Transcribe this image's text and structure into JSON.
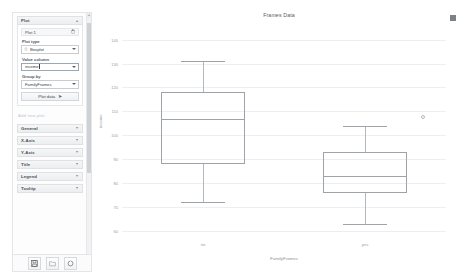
{
  "sidebar": {
    "plot_section": {
      "title": "Plot",
      "collapse_icon": "chevron-up-icon",
      "plot_item_label": "Plot 1",
      "delete_icon": "trash-icon",
      "fields": [
        {
          "label": "Plot type",
          "value": "Boxplot",
          "icon": "boxplot-icon"
        },
        {
          "label": "Value column",
          "value": "income",
          "icon": ""
        },
        {
          "label": "Group by",
          "value": "FamilyFrames",
          "icon": ""
        }
      ],
      "plot_button": "Plot data",
      "plot_button_icon": "arrow-right-icon",
      "hint_text": "Add new plot"
    },
    "sections": [
      {
        "label": "General",
        "chevron": "chevron-down-icon"
      },
      {
        "label": "X-Axis",
        "chevron": "chevron-down-icon"
      },
      {
        "label": "Y-Axis",
        "chevron": "chevron-down-icon"
      },
      {
        "label": "Title",
        "chevron": "chevron-down-icon"
      },
      {
        "label": "Legend",
        "chevron": "chevron-down-icon"
      },
      {
        "label": "Tooltip",
        "chevron": "chevron-down-icon"
      }
    ],
    "toolbar": [
      {
        "name": "save-icon",
        "title": "Save"
      },
      {
        "name": "open-folder-icon",
        "title": "Open"
      },
      {
        "name": "refresh-icon",
        "title": "Refresh"
      }
    ]
  },
  "chart_data": {
    "type": "box",
    "title": "Frames Data",
    "xlabel": "FamilyFrames",
    "ylabel": "income",
    "categories": [
      "no",
      "yes"
    ],
    "ylim": [
      58,
      144
    ],
    "yticks": [
      140,
      130,
      120,
      110,
      100,
      90,
      80,
      70,
      60
    ],
    "ytick_labels": [
      "140",
      "130",
      "120",
      "110",
      "100",
      "90",
      "80",
      "70",
      "60"
    ],
    "grid": true,
    "legend": "none",
    "boxes": [
      {
        "category": "no",
        "whisker_low": 72,
        "q1": 88,
        "median": 107,
        "q3": 118,
        "whisker_high": 131,
        "outliers": []
      },
      {
        "category": "yes",
        "whisker_low": 63,
        "q1": 76,
        "median": 83,
        "q3": 93,
        "whisker_high": 104,
        "outliers": [
          108
        ]
      }
    ]
  }
}
